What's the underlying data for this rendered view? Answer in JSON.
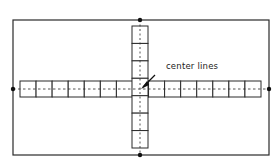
{
  "diagram": {
    "annotation": "center lines",
    "colors": {
      "stroke": "#2a2a2a",
      "background": "#ffffff"
    },
    "outer_rect": {
      "x": 13,
      "y": 20,
      "w": 256,
      "h": 135
    },
    "horizontal_strip": {
      "x": 20,
      "y": 81,
      "w": 241,
      "h": 16,
      "cells": 15
    },
    "vertical_strip": {
      "x": 132,
      "y": 26,
      "w": 16,
      "h": 122,
      "cells": 7
    },
    "center": {
      "x": 140,
      "y": 89
    },
    "markers": [
      {
        "name": "top",
        "x": 140,
        "y": 20
      },
      {
        "name": "bottom",
        "x": 140,
        "y": 155
      },
      {
        "name": "left",
        "x": 13,
        "y": 89
      },
      {
        "name": "right",
        "x": 269,
        "y": 89
      }
    ]
  }
}
